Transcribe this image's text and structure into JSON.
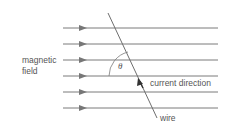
{
  "diagram": {
    "labels": {
      "magnetic_field_line1": "magnetic",
      "magnetic_field_line2": "field",
      "theta": "θ",
      "current_direction": "current direction",
      "wire": "wire"
    },
    "field_lines": {
      "count": 6,
      "y_positions": [
        28,
        44,
        60,
        76,
        92,
        108
      ],
      "x_start": 63,
      "x_end": 218,
      "arrow_x": 82,
      "direction": "right"
    },
    "wire_line": {
      "x1": 108,
      "y1": 13,
      "x2": 157,
      "y2": 118
    },
    "colors": {
      "line": "#7a7a7a",
      "arrow": "#777777",
      "wire": "#6e6e6e",
      "text": "#555555",
      "current_arrow": "#333333"
    }
  }
}
